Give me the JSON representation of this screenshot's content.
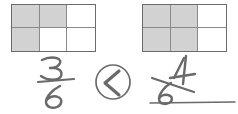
{
  "worksheet": {
    "type": "fraction-comparison",
    "left": {
      "model_label": "3x2 rectangle grid, 3 of 6 parts shaded",
      "rows": 2,
      "cols": 3,
      "total_parts": 6,
      "shaded_parts": 3,
      "shaded_cells": [
        0,
        1,
        3
      ],
      "handwritten_fraction": "3/6",
      "numerator": "3",
      "denominator": "6"
    },
    "comparison": {
      "symbol": "<",
      "symbol_name": "less-than",
      "circled": true
    },
    "right": {
      "model_label": "3x2 rectangle grid, 4 of 6 parts shaded",
      "rows": 2,
      "cols": 3,
      "total_parts": 6,
      "shaded_parts": 4,
      "shaded_cells": [
        0,
        1,
        3,
        4
      ],
      "handwritten_fraction": "4/6",
      "numerator": "4",
      "denominator": "6"
    },
    "baseline_rule": "horizontal writing line under right fraction"
  },
  "colors": {
    "shade_fill": "#d2d2d2",
    "grid_outline": "#6b6b6b",
    "grid_inner": "#8a8a8a",
    "ink": "#6a6a6a",
    "background": "#ffffff"
  }
}
